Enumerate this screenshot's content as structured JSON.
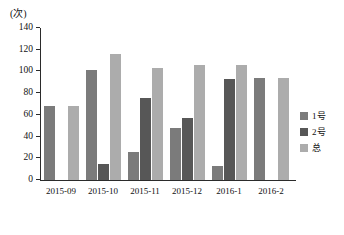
{
  "chart_data": {
    "type": "bar",
    "title": "",
    "subtitle": "",
    "xlabel": "",
    "ylabel": "(次)",
    "ylim": [
      0,
      140
    ],
    "ytick_step": 20,
    "yticks": [
      140,
      120,
      100,
      80,
      60,
      40,
      20,
      0
    ],
    "grid": false,
    "legend_position": "right",
    "categories": [
      "2015-09",
      "2015-10",
      "2015-11",
      "2015-12",
      "2016-1",
      "2016-2"
    ],
    "series": [
      {
        "name": "1号",
        "color": "#7b7b7b",
        "values": [
          68,
          101,
          26,
          48,
          13,
          94
        ]
      },
      {
        "name": "2号",
        "color": "#575757",
        "values": [
          null,
          15,
          76,
          57,
          93,
          null
        ]
      },
      {
        "name": "总",
        "color": "#acacac",
        "values": [
          68,
          116,
          103,
          106,
          106,
          94
        ]
      }
    ]
  },
  "legend": {
    "items": [
      {
        "label": "1号",
        "color": "#7b7b7b"
      },
      {
        "label": "2号",
        "color": "#575757"
      },
      {
        "label": "总",
        "color": "#acacac"
      }
    ]
  },
  "axis": {
    "y_unit_label": "(次)"
  }
}
